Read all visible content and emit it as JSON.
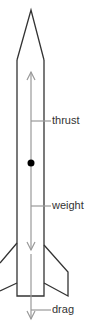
{
  "diagram": {
    "colors": {
      "outline": "#333333",
      "arrow": "#999999",
      "center_of_mass": "#000000",
      "text": "#333333"
    },
    "labels": {
      "thrust": "thrust",
      "weight": "weight",
      "drag": "drag"
    },
    "forces": [
      {
        "name": "thrust",
        "direction": "up"
      },
      {
        "name": "weight",
        "direction": "down"
      },
      {
        "name": "drag",
        "direction": "down"
      }
    ],
    "center_of_mass_marker": "filled-dot"
  }
}
